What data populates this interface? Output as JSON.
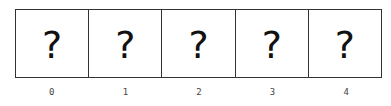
{
  "cells": [
    {
      "symbol": "?",
      "index": "0"
    },
    {
      "symbol": "?",
      "index": "1"
    },
    {
      "symbol": "?",
      "index": "2"
    },
    {
      "symbol": "?",
      "index": "3"
    },
    {
      "symbol": "?",
      "index": "4"
    }
  ]
}
